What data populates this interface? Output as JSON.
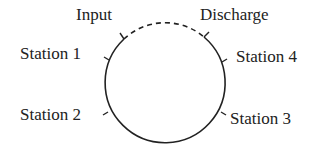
{
  "diagram": {
    "labels": {
      "input": "Input",
      "discharge": "Discharge",
      "station1": "Station 1",
      "station2": "Station 2",
      "station3": "Station 3",
      "station4": "Station 4"
    },
    "circle": {
      "cx": 165,
      "cy": 83,
      "r": 60,
      "stroke": "#222222"
    }
  }
}
